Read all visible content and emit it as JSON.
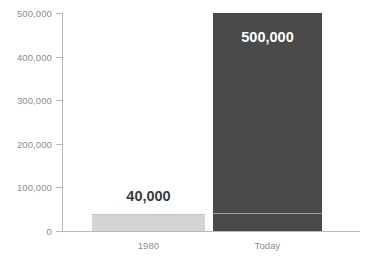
{
  "chart_data": {
    "type": "bar",
    "title": "",
    "subtitle": "",
    "xlabel": "",
    "ylabel": "",
    "categories": [
      "1980",
      "Today"
    ],
    "values": [
      40000,
      500000
    ],
    "data_labels": [
      "40,000",
      "500,000"
    ],
    "ylim": [
      0,
      500000
    ],
    "y_ticks": [
      0,
      100000,
      200000,
      300000,
      400000,
      500000
    ],
    "y_tick_labels": [
      "0",
      "100,000",
      "200,000",
      "300,000",
      "400,000",
      "500,000"
    ],
    "grid": false,
    "legend": null,
    "legend_position": "none",
    "series": [
      {
        "name": "",
        "values": [
          40000,
          500000
        ]
      }
    ],
    "annotations": [
      {
        "name": "reference-line-40000",
        "value": 40000,
        "applies_to": "Today",
        "description": "light horizontal line inside the dark bar at the 40,000 level"
      }
    ],
    "colors": {
      "bar_1980": "#d4d4d4",
      "bar_today": "#4a4a4a",
      "axis": "#b9b9b9",
      "tick_label": "#8d8d8d",
      "data_label_dark": "#3a3a3a",
      "data_label_light": "#ffffff",
      "reference_line": "#9c9c9c",
      "background": "#ffffff"
    }
  }
}
